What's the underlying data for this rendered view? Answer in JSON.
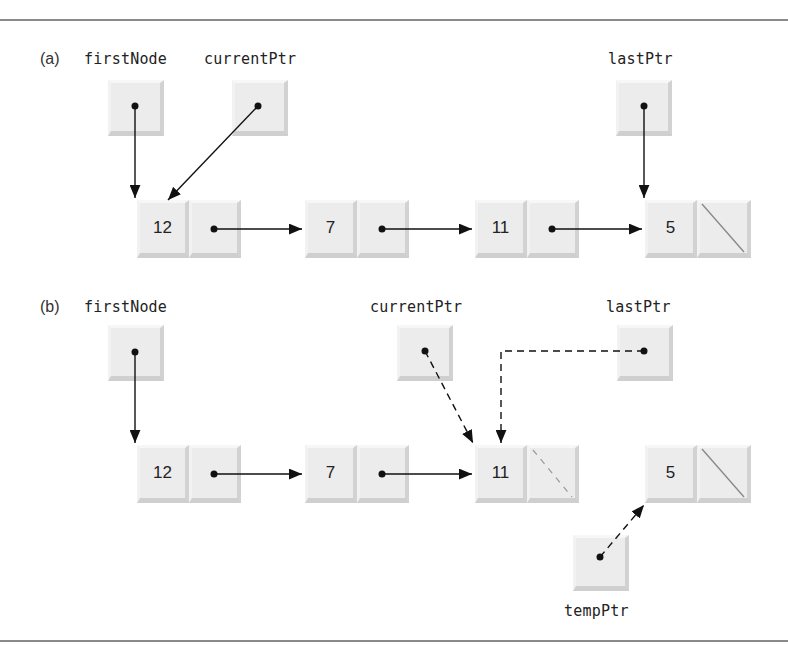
{
  "figure": {
    "parts": [
      {
        "id": "a",
        "label": "(a)",
        "pointers": [
          {
            "name": "firstNode",
            "label": "firstNode"
          },
          {
            "name": "currentPtr",
            "label": "currentPtr"
          },
          {
            "name": "lastPtr",
            "label": "lastPtr"
          }
        ],
        "nodes": [
          {
            "value": "12",
            "next": "node-7"
          },
          {
            "value": "7",
            "next": "node-11"
          },
          {
            "value": "11",
            "next": "node-5"
          },
          {
            "value": "5",
            "next": "null"
          }
        ],
        "links": [
          {
            "from": "firstNode",
            "to": "12",
            "style": "solid"
          },
          {
            "from": "currentPtr",
            "to": "12",
            "style": "solid"
          },
          {
            "from": "lastPtr",
            "to": "5",
            "style": "solid"
          }
        ]
      },
      {
        "id": "b",
        "label": "(b)",
        "pointers": [
          {
            "name": "firstNode",
            "label": "firstNode"
          },
          {
            "name": "currentPtr",
            "label": "currentPtr"
          },
          {
            "name": "lastPtr",
            "label": "lastPtr"
          },
          {
            "name": "tempPtr",
            "label": "tempPtr"
          }
        ],
        "nodes": [
          {
            "value": "12",
            "next": "node-7"
          },
          {
            "value": "7",
            "next": "node-11"
          },
          {
            "value": "11",
            "next": "null (dashed)"
          },
          {
            "value": "5",
            "next": "null"
          }
        ],
        "links": [
          {
            "from": "firstNode",
            "to": "12",
            "style": "solid"
          },
          {
            "from": "currentPtr",
            "to": "11",
            "style": "dashed"
          },
          {
            "from": "lastPtr",
            "to": "11",
            "style": "dashed"
          },
          {
            "from": "tempPtr",
            "to": "5",
            "style": "dashed"
          }
        ]
      }
    ]
  },
  "colors": {
    "box_fill": "#ececec",
    "box_shadow": "#cfcfcf",
    "arrow": "#111111",
    "rule": "#8a8a8a"
  }
}
